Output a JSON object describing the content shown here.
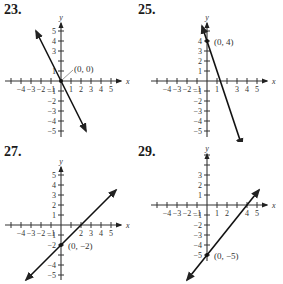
{
  "chart_data": [
    {
      "type": "line",
      "problem_number": "23.",
      "xlabel": "x",
      "ylabel": "y",
      "xlim": [
        -5,
        5
      ],
      "ylim": [
        -5,
        5
      ],
      "x_tick_labels": [
        "-4",
        "-3",
        "-2",
        "-1",
        "1",
        "2",
        "3",
        "4",
        "5"
      ],
      "y_tick_labels": [
        "5",
        "4",
        "3",
        "1",
        "-1",
        "-2",
        "-3",
        "-4",
        "-5"
      ],
      "line": {
        "slope": -2,
        "intercept": 0,
        "from": [
          -2.5,
          5
        ],
        "to": [
          2.5,
          -5
        ]
      },
      "point": {
        "x": 0,
        "y": 0,
        "label": "(0, 0)"
      },
      "grid": false
    },
    {
      "type": "line",
      "problem_number": "25.",
      "xlabel": "x",
      "ylabel": "y",
      "xlim": [
        -5,
        5
      ],
      "ylim": [
        -5,
        5
      ],
      "x_tick_labels": [
        "-4",
        "-3",
        "-2",
        "-1",
        "1",
        "3",
        "4",
        "5"
      ],
      "y_tick_labels": [
        "4",
        "3",
        "2",
        "1",
        "-1",
        "-2",
        "-3",
        "-4",
        "-5"
      ],
      "line": {
        "slope": -3,
        "intercept": 4,
        "from": [
          -0.5,
          5.5
        ],
        "to": [
          3.5,
          -6.5
        ]
      },
      "point": {
        "x": 0,
        "y": 4,
        "label": "(0, 4)"
      },
      "grid": false
    },
    {
      "type": "line",
      "problem_number": "27.",
      "xlabel": "x",
      "ylabel": "y",
      "xlim": [
        -5,
        5
      ],
      "ylim": [
        -5,
        5
      ],
      "x_tick_labels": [
        "-4",
        "-3",
        "-2",
        "-1",
        "2",
        "3",
        "4",
        "5"
      ],
      "y_tick_labels": [
        "5",
        "4",
        "3",
        "2",
        "1",
        "-1",
        "-2",
        "-4",
        "-5"
      ],
      "line": {
        "slope": 1,
        "intercept": -2,
        "from": [
          -3.5,
          -5.5
        ],
        "to": [
          5.5,
          3.5
        ]
      },
      "point": {
        "x": 0,
        "y": -2,
        "label": "(0, −2)"
      },
      "grid": false
    },
    {
      "type": "line",
      "problem_number": "29.",
      "xlabel": "x",
      "ylabel": "y",
      "xlim": [
        -5,
        5
      ],
      "ylim": [
        -5,
        5
      ],
      "x_tick_labels": [
        "-4",
        "-3",
        "-2",
        "-1",
        "1",
        "2",
        "4",
        "5"
      ],
      "y_tick_labels": [
        "3",
        "2",
        "1",
        "-1",
        "-2",
        "-3",
        "-4",
        "-5"
      ],
      "line": {
        "slope": 1.25,
        "intercept": -5,
        "from": [
          -2,
          -7.5
        ],
        "to": [
          5.2,
          1.5
        ]
      },
      "point": {
        "x": 0,
        "y": -5,
        "label": "(0, −5)"
      },
      "grid": false
    }
  ],
  "panels": [
    {
      "number": "23.",
      "point_label": "(0, 0)"
    },
    {
      "number": "25.",
      "point_label": "(0, 4)"
    },
    {
      "number": "27.",
      "point_label": "(0, −2)"
    },
    {
      "number": "29.",
      "point_label": "(0, −5)"
    }
  ],
  "axis_labels": {
    "x": "x",
    "y": "y"
  }
}
